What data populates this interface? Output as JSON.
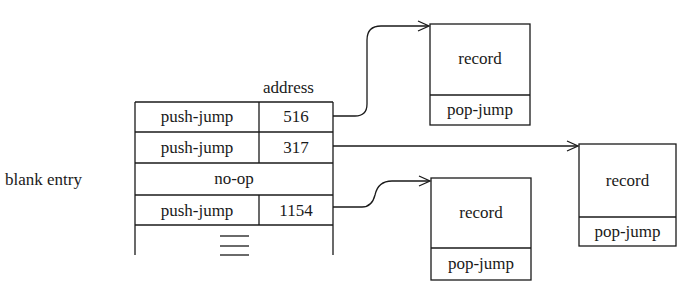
{
  "table": {
    "column_header": "address",
    "side_label": "blank entry",
    "rows": [
      {
        "op": "push-jump",
        "address": "516"
      },
      {
        "op": "push-jump",
        "address": "317"
      },
      {
        "op": "no-op",
        "address": ""
      },
      {
        "op": "push-jump",
        "address": "1154"
      }
    ],
    "continuation": "≡"
  },
  "records": [
    {
      "label": "record",
      "footer": "pop-jump",
      "target_of": "516"
    },
    {
      "label": "record",
      "footer": "pop-jump",
      "target_of": "317"
    },
    {
      "label": "record",
      "footer": "pop-jump",
      "target_of": "1154"
    }
  ]
}
